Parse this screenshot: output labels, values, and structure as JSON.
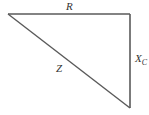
{
  "diagram": {
    "type": "impedance-triangle",
    "vertices": {
      "top_left": [
        8,
        14
      ],
      "top_right": [
        130,
        14
      ],
      "bottom_right": [
        130,
        108
      ]
    },
    "line_color": "#5a5a5a",
    "labels": {
      "top": "R",
      "right_main": "X",
      "right_sub": "C",
      "hypotenuse": "Z"
    }
  }
}
